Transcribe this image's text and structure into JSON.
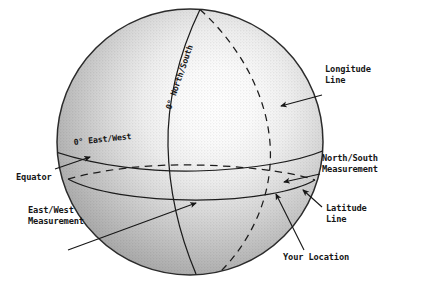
{
  "diagram": {
    "background_color": "#ffffff",
    "ink_color": "#161616",
    "globe": {
      "center_x": 190,
      "center_y": 142,
      "radius": 133,
      "shading": "radial-gradient highlight upper-right, halftone texture",
      "highlight_color": "#fdfdfd",
      "midtone_color": "#bdbdbd",
      "shadow_color": "#8e8e8e",
      "outline_color": "#2b2b2b"
    },
    "globe_labels": [
      {
        "id": "prime-meridian-label",
        "text": "0° North/South",
        "rotation_deg": -71,
        "x": 171,
        "y": 110
      },
      {
        "id": "equator-label",
        "text": "0° East/West",
        "rotation_deg": -6,
        "x": 74,
        "y": 145
      }
    ],
    "callouts": [
      {
        "id": "longitude-line",
        "lines": [
          "Longitude",
          "Line"
        ],
        "x": 325,
        "y": 70,
        "align": "left",
        "leader_from": [
          322,
          95
        ],
        "leader_to": [
          281,
          106
        ],
        "arrow_at": "leader_to"
      },
      {
        "id": "north-south-measurement",
        "lines": [
          "North/South",
          "Measurement"
        ],
        "x": 323,
        "y": 160,
        "align": "left",
        "leader_from": [
          320,
          174
        ],
        "leader_to": [
          284,
          182
        ],
        "arrow_at": "leader_to"
      },
      {
        "id": "latitude-line",
        "lines": [
          "Latitude",
          "Line"
        ],
        "x": 325,
        "y": 208,
        "align": "left",
        "leader_from": [
          322,
          208
        ],
        "leader_to": [
          303,
          190
        ],
        "arrow_at": "leader_to"
      },
      {
        "id": "your-location",
        "lines": [
          "Your Location"
        ],
        "x": 283,
        "y": 258,
        "align": "left",
        "leader_from": [
          302,
          252
        ],
        "leader_to": [
          276,
          194
        ],
        "arrow_at": "leader_to"
      },
      {
        "id": "equator",
        "lines": [
          "Equator"
        ],
        "x": 17,
        "y": 172,
        "align": "left",
        "leader_from": [
          55,
          169
        ],
        "leader_to": [
          90,
          157
        ],
        "arrow_at": "leader_to"
      },
      {
        "id": "east-west-measurement",
        "lines": [
          "East/West",
          "Measurement"
        ],
        "x": 28,
        "y": 208,
        "align": "left",
        "leader_from": [
          68,
          250
        ],
        "leader_to": [
          196,
          203
        ],
        "arrow_at": "leader_to"
      }
    ],
    "grid_lines": [
      {
        "id": "prime-meridian",
        "type": "longitude",
        "style": "solid",
        "visible_face": "front"
      },
      {
        "id": "longitude-line-right",
        "type": "longitude",
        "style": "dashed",
        "visible_face": "back"
      },
      {
        "id": "equator-line",
        "type": "equator",
        "style": "solid",
        "visible_face": "front"
      },
      {
        "id": "equator-line-back",
        "type": "equator",
        "style": "dashed",
        "visible_face": "back"
      },
      {
        "id": "latitude-line-south",
        "type": "latitude",
        "style": "solid",
        "visible_face": "front"
      },
      {
        "id": "latitude-line-south-back",
        "type": "latitude",
        "style": "dashed",
        "visible_face": "back"
      }
    ]
  }
}
